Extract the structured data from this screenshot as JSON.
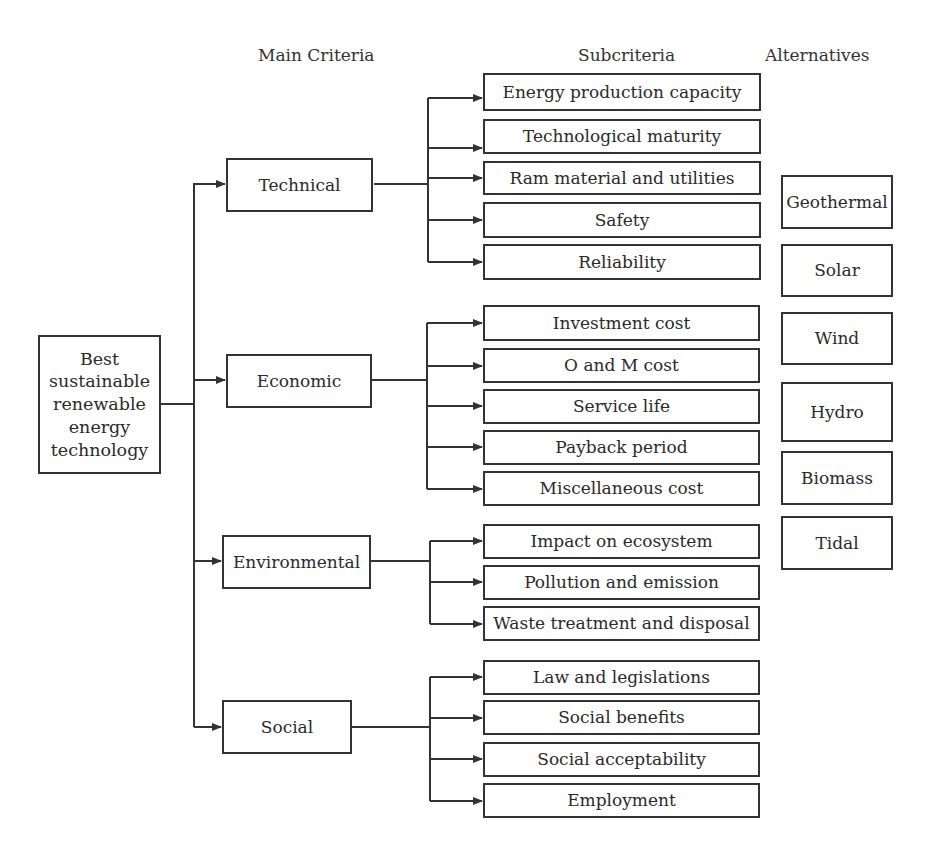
{
  "headers": {
    "main_criteria": "Main Criteria",
    "subcriteria": "Subcriteria",
    "alternatives": "Alternatives"
  },
  "goal": {
    "lines": [
      "Best",
      "sustainable",
      "renewable",
      "energy",
      "technology"
    ]
  },
  "criteria": [
    {
      "label": "Technical",
      "subcriteria": [
        "Energy production capacity",
        "Technological maturity",
        "Ram material and utilities",
        "Safety",
        "Reliability"
      ]
    },
    {
      "label": "Economic",
      "subcriteria": [
        "Investment cost",
        "O and M cost",
        "Service life",
        "Payback period",
        "Miscellaneous cost"
      ]
    },
    {
      "label": "Environmental",
      "subcriteria": [
        "Impact on ecosystem",
        "Pollution and emission",
        "Waste treatment and disposal"
      ]
    },
    {
      "label": "Social",
      "subcriteria": [
        "Law and legislations",
        "Social benefits",
        "Social acceptability",
        "Employment"
      ]
    }
  ],
  "alternatives": [
    "Geothermal",
    "Solar",
    "Wind",
    "Hydro",
    "Biomass",
    "Tidal"
  ],
  "colors": {
    "line": "#333333",
    "text": "#2a2a2a",
    "background": "#ffffff"
  }
}
